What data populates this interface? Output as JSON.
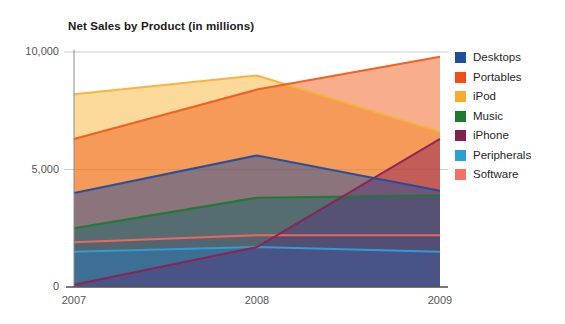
{
  "chart_data": {
    "type": "area",
    "stacked": true,
    "title": "Net Sales by Product (in millions)",
    "xlabel": "",
    "ylabel": "",
    "x": [
      "2007",
      "2008",
      "2009"
    ],
    "categories": [
      "2007",
      "2008",
      "2009"
    ],
    "ylim": [
      0,
      10000
    ],
    "yticks": [
      0,
      5000,
      10000
    ],
    "ytick_labels": [
      "0",
      "5,000",
      "10,000"
    ],
    "grid": true,
    "legend_position": "right",
    "series": [
      {
        "name": "Desktops",
        "color": "#1f4e9c",
        "values": [
          4000,
          5600,
          4100
        ]
      },
      {
        "name": "Portables",
        "color": "#f25c1a",
        "values": [
          6300,
          8400,
          9800
        ]
      },
      {
        "name": "iPod",
        "color": "#f5b335",
        "values": [
          8200,
          9000,
          6600
        ]
      },
      {
        "name": "Music",
        "color": "#1e7a2e",
        "values": [
          2500,
          3800,
          3900
        ]
      },
      {
        "name": "iPhone",
        "color": "#8e2153",
        "values": [
          100,
          1700,
          6300
        ]
      },
      {
        "name": "Peripherals",
        "color": "#2e9fd4",
        "values": [
          1500,
          1700,
          1500
        ]
      },
      {
        "name": "Software",
        "color": "#f2685f",
        "values": [
          1900,
          2200,
          2200
        ]
      }
    ],
    "annotations": []
  },
  "axes": {
    "y_labels": [
      "10,000",
      "5,000",
      "0"
    ],
    "x_labels": [
      "2007",
      "2008",
      "2009"
    ]
  },
  "legend": {
    "items": [
      {
        "label": "Desktops",
        "color": "#1f4e9c"
      },
      {
        "label": "Portables",
        "color": "#f04e14"
      },
      {
        "label": "iPod",
        "color": "#f4ab2e"
      },
      {
        "label": "Music",
        "color": "#1e7a2e"
      },
      {
        "label": "iPhone",
        "color": "#7e2250"
      },
      {
        "label": "Peripherals",
        "color": "#2e9fd4"
      },
      {
        "label": "Software",
        "color": "#f4716a"
      }
    ]
  }
}
